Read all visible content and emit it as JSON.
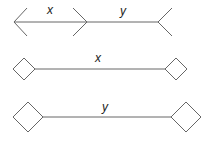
{
  "figure": {
    "row1": {
      "label_left": "x",
      "label_right": "y"
    },
    "row2": {
      "label": "x"
    },
    "row3": {
      "label": "y"
    }
  }
}
